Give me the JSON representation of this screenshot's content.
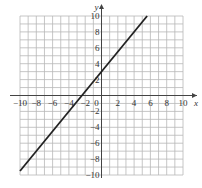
{
  "chart_data": {
    "type": "line",
    "title": "",
    "xlabel": "x",
    "ylabel": "y",
    "xlim": [
      -10,
      10
    ],
    "ylim": [
      -10,
      10
    ],
    "grid": true,
    "grid_step": 1,
    "x_ticks": [
      -10,
      -8,
      -6,
      -4,
      -2,
      0,
      2,
      4,
      6,
      8,
      10
    ],
    "y_ticks": [
      -10,
      -8,
      -6,
      -4,
      -2,
      2,
      4,
      6,
      8,
      10
    ],
    "series": [
      {
        "name": "line",
        "equation": "y = 1.25x + 3",
        "x": [
          -10,
          5.6
        ],
        "y": [
          -9.5,
          10
        ]
      }
    ],
    "colors": {
      "line": "#222222",
      "grid": "#b8b8b8",
      "axis": "#444444"
    }
  }
}
